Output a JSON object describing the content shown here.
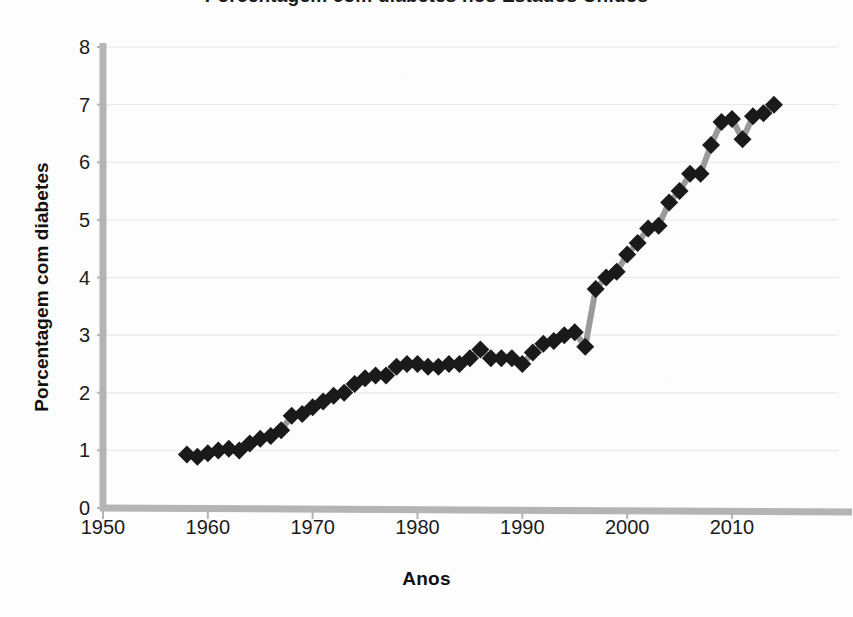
{
  "title": "Porcentagem com diabetes nos Estados Unidos",
  "axis": {
    "y_label": "Porcentagem com diabetes",
    "x_label": "Anos"
  },
  "ticks": {
    "y": [
      "0",
      "1",
      "2",
      "3",
      "4",
      "5",
      "6",
      "7",
      "8"
    ],
    "x": [
      "1950",
      "1960",
      "1970",
      "1980",
      "1990",
      "2000",
      "2010"
    ]
  },
  "colors": {
    "marker": "#1a1a1a",
    "line": "#9a9a9a",
    "axis": "#b4b4b4",
    "gridline": "#e6e6e6",
    "background": "#fdfdfd",
    "text": "#111111"
  },
  "chart_data": {
    "type": "line",
    "title": "Porcentagem com diabetes nos Estados Unidos",
    "xlabel": "Anos",
    "ylabel": "Porcentagem com diabetes",
    "xlim": [
      1950,
      2015
    ],
    "ylim": [
      0,
      8
    ],
    "xticks": [
      1950,
      1960,
      1970,
      1980,
      1990,
      2000,
      2010
    ],
    "yticks": [
      0,
      1,
      2,
      3,
      4,
      5,
      6,
      7,
      8
    ],
    "grid": true,
    "legend": false,
    "marker": "diamond",
    "series": [
      {
        "name": "Porcentagem com diabetes",
        "x": [
          1958,
          1959,
          1960,
          1961,
          1962,
          1963,
          1964,
          1965,
          1966,
          1967,
          1968,
          1969,
          1970,
          1971,
          1972,
          1973,
          1974,
          1975,
          1976,
          1977,
          1978,
          1979,
          1980,
          1981,
          1982,
          1983,
          1984,
          1985,
          1986,
          1987,
          1988,
          1989,
          1990,
          1991,
          1992,
          1993,
          1994,
          1995,
          1996,
          1997,
          1998,
          1999,
          2000,
          2001,
          2002,
          2003,
          2004,
          2005,
          2006,
          2007,
          2008,
          2009,
          2010,
          2011,
          2012,
          2013,
          2014
        ],
        "y": [
          0.93,
          0.89,
          0.95,
          1.0,
          1.03,
          1.0,
          1.12,
          1.2,
          1.25,
          1.35,
          1.6,
          1.63,
          1.75,
          1.85,
          1.95,
          2.0,
          2.15,
          2.25,
          2.3,
          2.3,
          2.45,
          2.5,
          2.5,
          2.45,
          2.45,
          2.5,
          2.5,
          2.6,
          2.75,
          2.6,
          2.6,
          2.6,
          2.5,
          2.7,
          2.85,
          2.9,
          3.0,
          3.05,
          2.8,
          3.8,
          4.0,
          4.1,
          4.4,
          4.6,
          4.85,
          4.9,
          5.3,
          5.5,
          5.8,
          5.8,
          6.3,
          6.7,
          6.75,
          6.4,
          6.8,
          6.85,
          7.0
        ]
      }
    ]
  }
}
